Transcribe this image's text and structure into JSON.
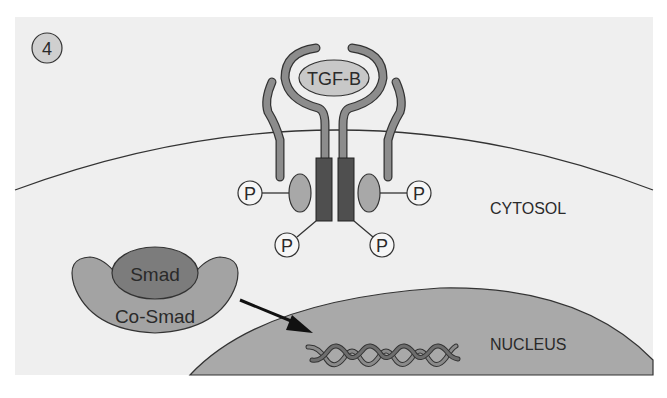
{
  "diagram": {
    "step_number": "4",
    "ligand_label": "TGF-B",
    "phosphate_label": "P",
    "smad_label": "Smad",
    "cosmad_label": "Co-Smad",
    "cytosol_label": "CYTOSOL",
    "nucleus_label": "NUCLEUS"
  },
  "colors": {
    "panel_background": "#efefef",
    "nucleus_fill": "#a9a9a9",
    "receptor_arm": "#8c8c8c",
    "ligand_fill": "#c8c8c8",
    "kinase_domain": "#4f4f4f",
    "receptor_knob": "#a8a8a8",
    "smad_fill": "#7c7c7c",
    "cosmad_fill": "#a3a3a3",
    "outline": "#333333"
  }
}
